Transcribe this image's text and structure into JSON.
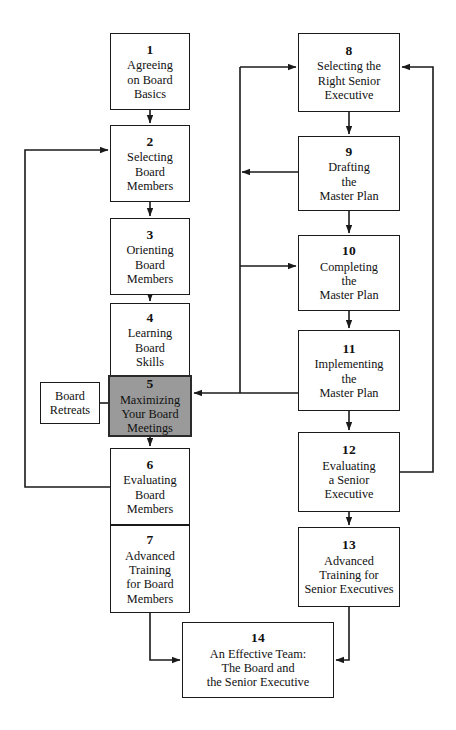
{
  "diagram": {
    "canvas": {
      "width": 456,
      "height": 730
    },
    "colors": {
      "background": "#ffffff",
      "box_fill": "#ffffff",
      "box_border": "#1a1a1a",
      "highlight_fill": "#9a9a9a",
      "highlight_border": "#2a2a2a",
      "connector": "#1a1a1a",
      "text": "#111111"
    }
  },
  "nodes": [
    {
      "id": "node-1",
      "number": "1",
      "label": "Agreeing\non Board\nBasics",
      "x": 110,
      "y": 33,
      "w": 80,
      "h": 77,
      "highlight": false
    },
    {
      "id": "node-2",
      "number": "2",
      "label": "Selecting\nBoard\nMembers",
      "x": 110,
      "y": 125,
      "w": 80,
      "h": 77,
      "highlight": false
    },
    {
      "id": "node-3",
      "number": "3",
      "label": "Orienting\nBoard\nMembers",
      "x": 110,
      "y": 218,
      "w": 80,
      "h": 77,
      "highlight": false
    },
    {
      "id": "node-4",
      "number": "4",
      "label": "Learning\nBoard\nSkills",
      "x": 110,
      "y": 303,
      "w": 80,
      "h": 73,
      "highlight": false
    },
    {
      "id": "node-5",
      "number": "5",
      "label": "Maximizing\nYour Board\nMeetings",
      "x": 108,
      "y": 375,
      "w": 84,
      "h": 62,
      "highlight": true
    },
    {
      "id": "node-6",
      "number": "6",
      "label": "Evaluating\nBoard\nMembers",
      "x": 110,
      "y": 448,
      "w": 80,
      "h": 77,
      "highlight": false
    },
    {
      "id": "node-7",
      "number": "7",
      "label": "Advanced\nTraining\nfor Board\nMembers",
      "x": 110,
      "y": 525,
      "w": 80,
      "h": 88,
      "highlight": false
    },
    {
      "id": "node-8",
      "number": "8",
      "label": "Selecting the\nRight Senior\nExecutive",
      "x": 298,
      "y": 33,
      "w": 102,
      "h": 79,
      "highlight": false
    },
    {
      "id": "node-9",
      "number": "9",
      "label": "Drafting\nthe\nMaster Plan",
      "x": 298,
      "y": 136,
      "w": 102,
      "h": 75,
      "highlight": false
    },
    {
      "id": "node-10",
      "number": "10",
      "label": "Completing\nthe\nMaster Plan",
      "x": 298,
      "y": 235,
      "w": 102,
      "h": 76,
      "highlight": false
    },
    {
      "id": "node-11",
      "number": "11",
      "label": "Implementing\nthe\nMaster Plan",
      "x": 298,
      "y": 330,
      "w": 102,
      "h": 81,
      "highlight": false
    },
    {
      "id": "node-12",
      "number": "12",
      "label": "Evaluating\na Senior\nExecutive",
      "x": 298,
      "y": 432,
      "w": 102,
      "h": 80,
      "highlight": false
    },
    {
      "id": "node-13",
      "number": "13",
      "label": "Advanced\nTraining for\nSenior Executives",
      "x": 298,
      "y": 527,
      "w": 102,
      "h": 80,
      "highlight": false
    },
    {
      "id": "node-14",
      "number": "14",
      "label": "An Effective Team:\nThe Board and\nthe Senior Executive",
      "x": 182,
      "y": 622,
      "w": 152,
      "h": 76,
      "highlight": false
    }
  ],
  "aux_nodes": [
    {
      "id": "node-board-retreats",
      "number": "",
      "label": "Board\nRetreats",
      "x": 40,
      "y": 382,
      "w": 60,
      "h": 42,
      "highlight": false
    }
  ],
  "connectors": [
    {
      "id": "c-1-2",
      "from": "node-1",
      "to": "node-2",
      "kind": "arrow",
      "points": "150,110 150,123"
    },
    {
      "id": "c-2-3",
      "from": "node-2",
      "to": "node-3",
      "kind": "arrow",
      "points": "150,202 150,216"
    },
    {
      "id": "c-3-4",
      "from": "node-3",
      "to": "node-4",
      "kind": "arrow",
      "points": "150,295 150,301"
    },
    {
      "id": "c-4-5",
      "from": "node-4",
      "to": "node-5",
      "kind": "arrow",
      "points": "150,376 150,373"
    },
    {
      "id": "c-5-6",
      "from": "node-5",
      "to": "node-6",
      "kind": "arrow",
      "points": "150,437 150,446"
    },
    {
      "id": "c-6-7",
      "from": "node-6",
      "to": "node-7",
      "kind": "arrow",
      "points": "150,525 150,523"
    },
    {
      "id": "c-8-9",
      "from": "node-8",
      "to": "node-9",
      "kind": "arrow",
      "points": "349,112 349,134"
    },
    {
      "id": "c-9-10",
      "from": "node-9",
      "to": "node-10",
      "kind": "arrow",
      "points": "349,211 349,233"
    },
    {
      "id": "c-10-11",
      "from": "node-10",
      "to": "node-11",
      "kind": "arrow",
      "points": "349,311 349,328"
    },
    {
      "id": "c-11-12",
      "from": "node-11",
      "to": "node-12",
      "kind": "arrow",
      "points": "349,411 349,430"
    },
    {
      "id": "c-12-13",
      "from": "node-12",
      "to": "node-13",
      "kind": "arrow",
      "points": "349,512 349,525"
    },
    {
      "id": "c-trunk-to-8",
      "from": "trunk",
      "to": "node-8",
      "kind": "arrow",
      "points": "240,67 296,67"
    },
    {
      "id": "c-9-to-trunk",
      "from": "node-9",
      "to": "trunk",
      "kind": "arrow",
      "points": "298,172 242,172"
    },
    {
      "id": "c-trunk-to-10",
      "from": "trunk",
      "to": "node-10",
      "kind": "arrow",
      "points": "240,266 296,266"
    },
    {
      "id": "c-trunk-vertical",
      "from": "trunk",
      "to": "trunk",
      "kind": "line",
      "points": "240,67 240,385"
    },
    {
      "id": "c-11-to-5",
      "from": "node-11",
      "to": "node-5",
      "kind": "arrow",
      "points": "298,393 194,393"
    },
    {
      "id": "c-trunk-join",
      "from": "trunk",
      "to": "node-5",
      "kind": "line",
      "points": "240,385 240,393"
    },
    {
      "id": "c-6-to-2",
      "from": "node-6",
      "to": "node-2",
      "kind": "arrow",
      "points": "110,487 25,487 25,150 108,150"
    },
    {
      "id": "c-12-to-8",
      "from": "node-12",
      "to": "node-8",
      "kind": "arrow",
      "points": "400,472 433,472 433,67 402,67"
    },
    {
      "id": "c-retreats-5",
      "from": "node-board-retreats",
      "to": "node-5",
      "kind": "line",
      "points": "100,403 108,403"
    },
    {
      "id": "c-7-to-14",
      "from": "node-7",
      "to": "node-14",
      "kind": "arrow",
      "points": "150,613 150,660 180,660"
    },
    {
      "id": "c-13-to-14",
      "from": "node-13",
      "to": "node-14",
      "kind": "arrow",
      "points": "349,607 349,660 336,660"
    }
  ]
}
